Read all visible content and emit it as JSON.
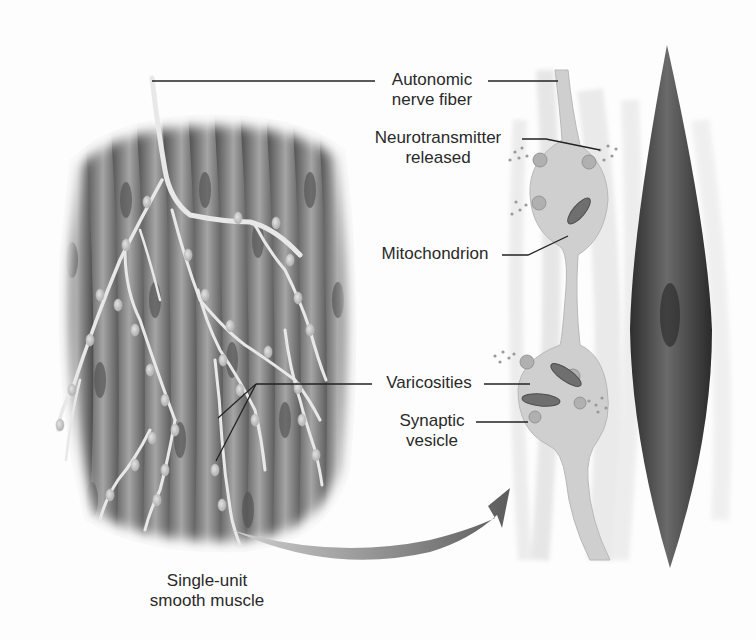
{
  "labels": {
    "autonomic": {
      "line1": "Autonomic",
      "line2": "nerve fiber"
    },
    "neurotransmitter": {
      "line1": "Neurotransmitter",
      "line2": "released"
    },
    "mitochondrion": {
      "line1": "Mitochondrion"
    },
    "varicosities": {
      "line1": "Varicosities"
    },
    "synaptic": {
      "line1": "Synaptic",
      "line2": "vesicle"
    },
    "muscle": {
      "line1": "Single-unit",
      "line2": "smooth muscle"
    }
  },
  "colors": {
    "background": "#fdfdfd",
    "tissue_dark": "#5a5a5a",
    "tissue_light": "#c8c8c8",
    "nerve": "#e6e6e6",
    "cell_dark": "#3c3c3c",
    "leader": "#222222",
    "arrow": "#6e6e6e"
  }
}
